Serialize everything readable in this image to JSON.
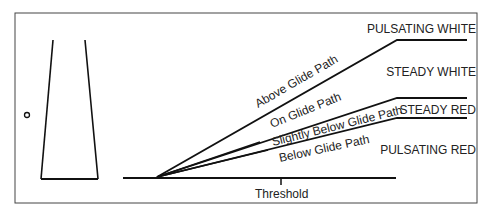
{
  "diagram": {
    "type": "VASI / PAPI-style glide path indicator",
    "path_labels": {
      "above": "Above Glide Path",
      "on": "On Glide Path",
      "slightly_below": "Slightly Below Glide Path",
      "below": "Below Glide Path"
    },
    "light_signals": {
      "pulsating_white": "PULSATING WHITE",
      "steady_white": "STEADY WHITE",
      "steady_red": "STEADY RED",
      "pulsating_red": "PULSATING RED"
    },
    "threshold_label": "Threshold"
  }
}
